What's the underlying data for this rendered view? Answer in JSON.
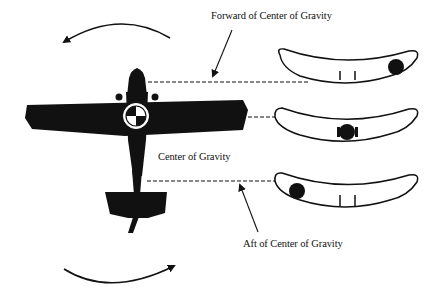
{
  "diagram": {
    "labels": {
      "forward": "Forward of Center of Gravity",
      "center": "Center of Gravity",
      "aft": "Aft of Center of Gravity"
    },
    "indicators": [
      {
        "name": "forward",
        "ball_position": "right"
      },
      {
        "name": "center",
        "ball_position": "center"
      },
      {
        "name": "aft",
        "ball_position": "left"
      }
    ],
    "rotation_arrows": [
      {
        "position": "top",
        "direction": "counter-clockwise"
      },
      {
        "position": "bottom",
        "direction": "clockwise"
      }
    ],
    "colors": {
      "ink": "#111111",
      "background": "#ffffff"
    }
  }
}
